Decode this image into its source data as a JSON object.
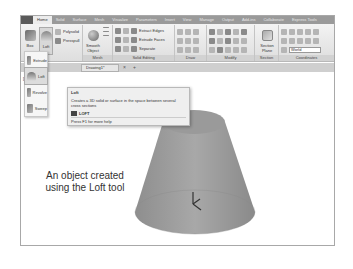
{
  "ribbon": {
    "tabs": [
      "Home",
      "Solid",
      "Surface",
      "Mesh",
      "Visualize",
      "Parameters",
      "Insert",
      "View",
      "Manage",
      "Output",
      "Add-ins",
      "Collaborate",
      "Express Tools"
    ],
    "active_tab": "Home",
    "modeling": {
      "box_label": "Box",
      "loft_label": "Loft",
      "polysolid_label": "Polysolid",
      "presspull_label": "Presspull"
    },
    "mesh": {
      "smooth_object_label_1": "Smooth",
      "smooth_object_label_2": "Object",
      "panel_label": "Mesh"
    },
    "solid_editing": {
      "extract_edges_label": "Extract Edges",
      "extrude_faces_label": "Extrude Faces",
      "separate_label": "Separate",
      "panel_label": "Solid Editing"
    },
    "draw": {
      "panel_label": "Draw"
    },
    "modify": {
      "panel_label": "Modify"
    },
    "section": {
      "section_plane_label_1": "Section",
      "section_plane_label_2": "Plane",
      "panel_label": "Section"
    },
    "coordinates": {
      "ucs_select_value": "World",
      "panel_label": "Coordinates"
    }
  },
  "file_tabs": {
    "active_file": "Drawing1*",
    "close_glyph": "×",
    "new_tab_glyph": "+"
  },
  "viewport": {
    "label": "[-][SE Is"
  },
  "dropdown": {
    "items": [
      {
        "label": "Extrude",
        "icon": "extrude-icon"
      },
      {
        "label": "Loft",
        "icon": "loft-icon"
      },
      {
        "label": "Revolve",
        "icon": "revolve-icon"
      },
      {
        "label": "Sweep",
        "icon": "sweep-icon"
      }
    ]
  },
  "tooltip": {
    "title": "Loft",
    "description": "Creates a 3D solid or surface in the space between several cross sections",
    "command": "LOFT",
    "help": "Press F1 for more help"
  },
  "caption": {
    "line1": "An object created",
    "line2": "using the Loft tool"
  },
  "colors": {
    "tab_bar": "#9a9a9a",
    "ribbon_bg": "#e6e6e6",
    "tooltip_bg": "#efefef",
    "cone_fill": "#9d9d9d"
  }
}
